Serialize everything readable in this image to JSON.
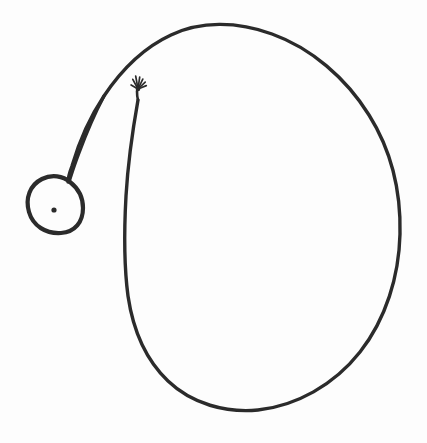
{
  "figure": {
    "medium": "pen-and-ink sketch",
    "background_color": "#fdfdfd",
    "ink_color": "#2b2b2b",
    "canvas": {
      "width": 427,
      "height": 443
    }
  },
  "shapes": {
    "main_loop": {
      "name": "large open oval loop",
      "stroke_width": 3.4,
      "bounds": {
        "x_min": 124,
        "y_min": 25,
        "x_max": 401,
        "y_max": 413
      },
      "extreme_points": {
        "top": [
          231,
          27
        ],
        "right": [
          400,
          216
        ],
        "bottom": [
          246,
          411
        ],
        "left_inner": [
          125,
          300
        ]
      },
      "path": "M 139,92 C 131,140 126,200 126,260 C 126,320 140,362 170,389 C 200,414 243,414 282,400 C 330,383 370,340 390,288 C 408,240 404,186 385,140 C 364,90 322,50 272,33 C 225,17 176,24 140,52 C 110,75 90,110 76,150 C 70,166 68,176 68,180"
    },
    "tail_to_circle": {
      "name": "tail stroke descending to the small circle",
      "stroke_width": 3.2,
      "start_point": [
        140,
        52
      ],
      "end_point": [
        69,
        180
      ]
    },
    "small_circle": {
      "name": "small circle with center dot",
      "stroke_width": 4.2,
      "center": [
        55,
        205
      ],
      "radius_x": 27,
      "radius_y": 28,
      "bounds": {
        "x_min": 28,
        "y_min": 177,
        "x_max": 83,
        "y_max": 233
      }
    },
    "center_dot": {
      "name": "dot at circle center",
      "center": [
        54,
        210
      ],
      "radius": 2.6
    },
    "starburst": {
      "name": "splayed starburst terminus on inner stroke",
      "center": [
        138,
        89
      ],
      "spike_count": 7,
      "spread_radius": 11,
      "stroke_width": 1.7,
      "spikes": [
        {
          "angle_deg": -118,
          "length": 11
        },
        {
          "angle_deg": -100,
          "length": 13
        },
        {
          "angle_deg": -82,
          "length": 12
        },
        {
          "angle_deg": -64,
          "length": 11
        },
        {
          "angle_deg": -44,
          "length": 10
        },
        {
          "angle_deg": -22,
          "length": 9
        },
        {
          "angle_deg": -150,
          "length": 8
        }
      ]
    }
  }
}
